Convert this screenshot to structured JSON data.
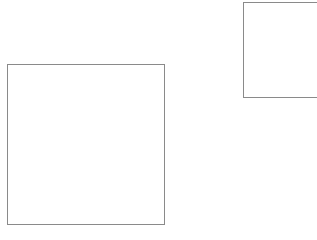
{
  "canvas": {
    "width": 317,
    "height": 240,
    "background_color": "#ffffff",
    "description": "Blank white canvas containing two thin outlined rectangles"
  },
  "style": {
    "stroke_color": "#8a8a8a",
    "stroke_width_px": 1,
    "fill": "none"
  },
  "shapes": [
    {
      "name": "large-rectangle",
      "type": "rectangle",
      "x": 7,
      "y": 64,
      "width": 158,
      "height": 161,
      "stroke_color": "#8a8a8a",
      "fill": "none",
      "clipped": false
    },
    {
      "name": "clipped-rectangle",
      "type": "rectangle",
      "x": 243,
      "y": 2,
      "width": 120,
      "height": 96,
      "stroke_color": "#8a8a8a",
      "fill": "none",
      "clipped": true,
      "clipped_edge": "right"
    }
  ]
}
